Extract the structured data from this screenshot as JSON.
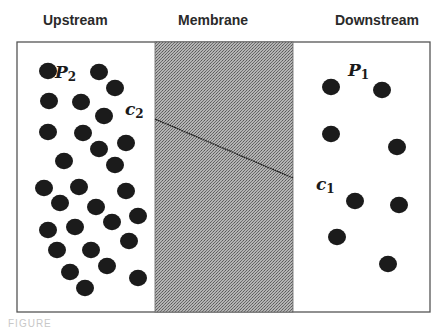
{
  "headings": {
    "upstream": "Upstream",
    "membrane": "Membrane",
    "downstream": "Downstream"
  },
  "labels": {
    "upstream_pressure": "P",
    "upstream_pressure_sub": "2",
    "upstream_concentration": "c",
    "upstream_concentration_sub": "2",
    "downstream_pressure": "P",
    "downstream_pressure_sub": "1",
    "downstream_concentration": "c",
    "downstream_concentration_sub": "1"
  },
  "colors": {
    "border": "#555555",
    "membrane_fill": "#9a9a9a",
    "molecule": "#1b1b1b",
    "gradient_line": "#222222"
  },
  "diagram": {
    "frame": {
      "x": 17,
      "y": 42,
      "width": 413,
      "height": 270
    },
    "membrane": {
      "x": 155,
      "y": 42,
      "width": 138,
      "height": 270
    },
    "concentration_profile": {
      "x1": 155,
      "y1": 119,
      "x2": 293,
      "y2": 178
    },
    "molecule_radius": 9,
    "upstream_molecules": [
      [
        48,
        71
      ],
      [
        99,
        72
      ],
      [
        115,
        88
      ],
      [
        49,
        101
      ],
      [
        81,
        102
      ],
      [
        104,
        116
      ],
      [
        48,
        132
      ],
      [
        83,
        133
      ],
      [
        99,
        149
      ],
      [
        126,
        143
      ],
      [
        64,
        161
      ],
      [
        115,
        165
      ],
      [
        44,
        188
      ],
      [
        79,
        187
      ],
      [
        126,
        191
      ],
      [
        60,
        203
      ],
      [
        96,
        207
      ],
      [
        138,
        216
      ],
      [
        112,
        222
      ],
      [
        48,
        230
      ],
      [
        75,
        227
      ],
      [
        129,
        241
      ],
      [
        57,
        250
      ],
      [
        91,
        250
      ],
      [
        107,
        266
      ],
      [
        70,
        272
      ],
      [
        138,
        278
      ],
      [
        85,
        288
      ]
    ],
    "downstream_molecules": [
      [
        331,
        87
      ],
      [
        382,
        90
      ],
      [
        331,
        134
      ],
      [
        397,
        147
      ],
      [
        355,
        201
      ],
      [
        399,
        205
      ],
      [
        337,
        237
      ],
      [
        388,
        264
      ]
    ]
  },
  "caption": "FIGURE"
}
